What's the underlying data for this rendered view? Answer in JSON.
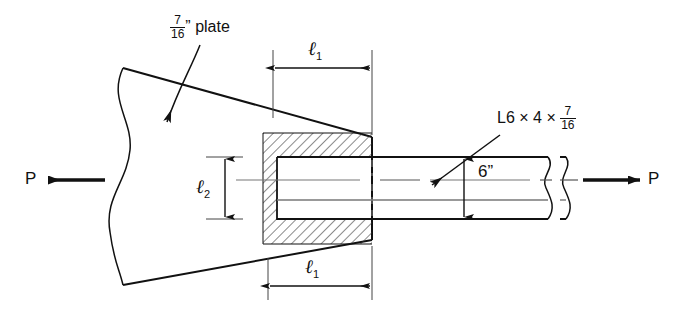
{
  "figure": {
    "background_color": "#ffffff",
    "line_color": "#111111",
    "thin_line_color": "#666666"
  },
  "labels": {
    "plate": {
      "numerator": "7",
      "denominator": "16",
      "unit": "”",
      "text": "plate",
      "name": "plate-thickness-label"
    },
    "angle": {
      "prefix": "L6 × 4 × ",
      "numerator": "7",
      "denominator": "16",
      "name": "angle-designation-label"
    },
    "depth": {
      "value": "6”",
      "name": "angle-depth-dimension-label"
    },
    "force_left": "P",
    "force_right": "P",
    "weld_length_top": {
      "symbol": "ℓ",
      "subscript": "1"
    },
    "weld_length_bottom": {
      "symbol": "ℓ",
      "subscript": "1"
    },
    "weld_length_vertical": {
      "symbol": "ℓ",
      "subscript": "2"
    }
  }
}
